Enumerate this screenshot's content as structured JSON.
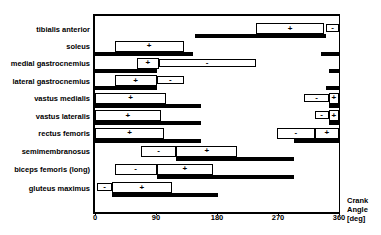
{
  "figure": {
    "background": "#ffffff",
    "ink": "#000000"
  },
  "chart_data": {
    "type": "bar",
    "subtype": "horizontal-activation-timing",
    "title": "",
    "xlabel": "Crank Angle [deg]",
    "xlabel_lines": [
      "Crank",
      "Angle",
      "[deg]"
    ],
    "xlim": [
      0,
      360
    ],
    "x_ticks": [
      "0",
      "90",
      "180",
      "270",
      "360"
    ],
    "legend": "thick black bars = activation period; open boxes with + or - = marked timing ranges",
    "muscles": [
      {
        "name": "tibialis anterior",
        "bars": [
          [
            148,
            341
          ]
        ],
        "boxes": [
          {
            "start": 238,
            "end": 338,
            "sign": "+",
            "shallow": false
          },
          {
            "start": 341,
            "end": 360,
            "sign": "-",
            "shallow": true
          }
        ]
      },
      {
        "name": "soleus",
        "bars": [
          [
            0,
            145
          ],
          [
            334,
            360
          ]
        ],
        "boxes": [
          {
            "start": 29,
            "end": 131,
            "sign": "+",
            "shallow": false
          }
        ]
      },
      {
        "name": "medial gastrocnemius",
        "bars": [
          [
            0,
            91
          ],
          [
            345,
            360
          ]
        ],
        "boxes": [
          {
            "start": 62,
            "end": 94,
            "sign": "+",
            "shallow": false
          },
          {
            "start": 94,
            "end": 237,
            "sign": "-",
            "shallow": true
          }
        ]
      },
      {
        "name": "lateral gastrocnemius",
        "bars": [
          [
            0,
            91
          ],
          [
            341,
            360
          ]
        ],
        "boxes": [
          {
            "start": 29,
            "end": 91,
            "sign": "+",
            "shallow": false
          },
          {
            "start": 91,
            "end": 131,
            "sign": "-",
            "shallow": true
          }
        ]
      },
      {
        "name": "vastus medialis",
        "bars": [
          [
            0,
            157
          ],
          [
            345,
            360
          ]
        ],
        "boxes": [
          {
            "start": 0,
            "end": 105,
            "sign": "+",
            "shallow": false
          },
          {
            "start": 309,
            "end": 345,
            "sign": "-",
            "shallow": true
          },
          {
            "start": 345,
            "end": 360,
            "sign": "+",
            "shallow": false
          }
        ]
      },
      {
        "name": "vastus lateralis",
        "bars": [
          [
            0,
            157
          ],
          [
            345,
            360
          ]
        ],
        "boxes": [
          {
            "start": 0,
            "end": 97,
            "sign": "+",
            "shallow": false
          },
          {
            "start": 324,
            "end": 345,
            "sign": "-",
            "shallow": true
          },
          {
            "start": 345,
            "end": 360,
            "sign": "+",
            "shallow": false
          }
        ]
      },
      {
        "name": "rectus femoris",
        "bars": [
          [
            0,
            157
          ],
          [
            293,
            360
          ]
        ],
        "boxes": [
          {
            "start": 0,
            "end": 102,
            "sign": "+",
            "shallow": false
          },
          {
            "start": 269,
            "end": 324,
            "sign": "-",
            "shallow": false
          },
          {
            "start": 324,
            "end": 360,
            "sign": "+",
            "shallow": false
          }
        ]
      },
      {
        "name": "semimembranosus",
        "bars": [
          [
            120,
            293
          ]
        ],
        "boxes": [
          {
            "start": 68,
            "end": 120,
            "sign": "-",
            "shallow": false
          },
          {
            "start": 120,
            "end": 210,
            "sign": "+",
            "shallow": false
          }
        ]
      },
      {
        "name": "biceps femoris (long)",
        "bars": [
          [
            91,
            293
          ]
        ],
        "boxes": [
          {
            "start": 29,
            "end": 91,
            "sign": "-",
            "shallow": false
          },
          {
            "start": 91,
            "end": 174,
            "sign": "+",
            "shallow": false
          }
        ]
      },
      {
        "name": "gluteus maximus",
        "bars": [
          [
            25,
            181
          ]
        ],
        "boxes": [
          {
            "start": 3,
            "end": 25,
            "sign": "-",
            "shallow": true
          },
          {
            "start": 25,
            "end": 113,
            "sign": "+",
            "shallow": false
          }
        ]
      }
    ]
  }
}
